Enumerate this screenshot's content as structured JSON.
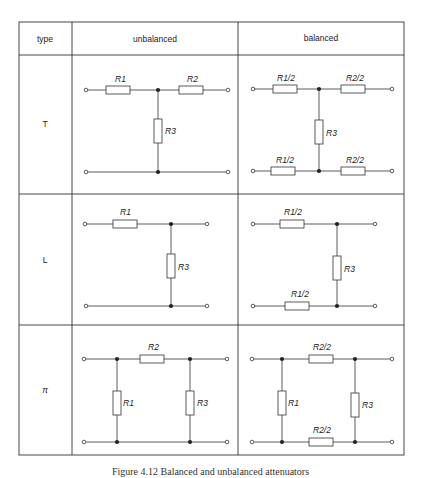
{
  "table": {
    "headers": {
      "type": "type",
      "unbalanced": "unbalanced",
      "balanced": "balanced"
    },
    "rows": [
      {
        "type": "T",
        "unbalanced": {
          "labels": {
            "r1": "R1",
            "r2": "R2",
            "r3": "R3"
          }
        },
        "balanced": {
          "labels": {
            "top_left": "R1/2",
            "top_right": "R2/2",
            "shunt": "R3",
            "bottom_left": "R1/2",
            "bottom_right": "R2/2"
          }
        }
      },
      {
        "type": "L",
        "unbalanced": {
          "labels": {
            "r1": "R1",
            "r3": "R3"
          }
        },
        "balanced": {
          "labels": {
            "top": "R1/2",
            "shunt": "R3",
            "bottom": "R1/2"
          }
        }
      },
      {
        "type": "π",
        "unbalanced": {
          "labels": {
            "r2": "R2",
            "r1": "R1",
            "r3": "R3"
          }
        },
        "balanced": {
          "labels": {
            "top": "R2/2",
            "r1": "R1",
            "r3": "R3",
            "bottom": "R2/2"
          }
        }
      }
    ]
  },
  "caption": "Figure 4.12 Balanced and unbalanced attenuators",
  "colors": {
    "line": "#333333",
    "background": "#ffffff"
  }
}
